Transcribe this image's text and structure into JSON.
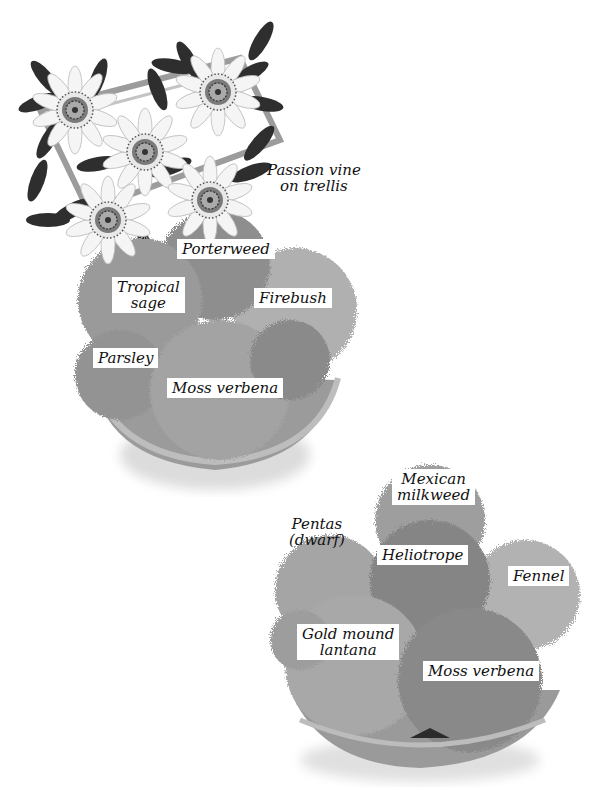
{
  "figure": {
    "colors": {
      "background": "#ffffff",
      "pot": "#9a9a9a",
      "pot_rim": "#b3b3b3",
      "pot_shadow": "#d9d9d9",
      "foliage_light": "#a8a8a8",
      "foliage_mid": "#8f8f8f",
      "foliage_dark": "#707070",
      "leaf_dark": "#2b2b2b",
      "flower_petal": "#f4f4f4",
      "trellis": "#9c9c9c"
    }
  },
  "container1": {
    "labels": {
      "passion_vine": [
        "Passion vine",
        "on trellis"
      ],
      "porterweed": [
        "Porterweed"
      ],
      "tropical_sage": [
        "Tropical",
        "sage"
      ],
      "firebush": [
        "Firebush"
      ],
      "parsley": [
        "Parsley"
      ],
      "moss_verbena": [
        "Moss verbena"
      ]
    }
  },
  "container2": {
    "labels": {
      "mexican_milkweed": [
        "Mexican",
        "milkweed"
      ],
      "pentas": [
        "Pentas",
        "(dwarf)"
      ],
      "heliotrope": [
        "Heliotrope"
      ],
      "fennel": [
        "Fennel"
      ],
      "gold_mound_lantana": [
        "Gold mound",
        "lantana"
      ],
      "moss_verbena": [
        "Moss verbena"
      ]
    }
  }
}
